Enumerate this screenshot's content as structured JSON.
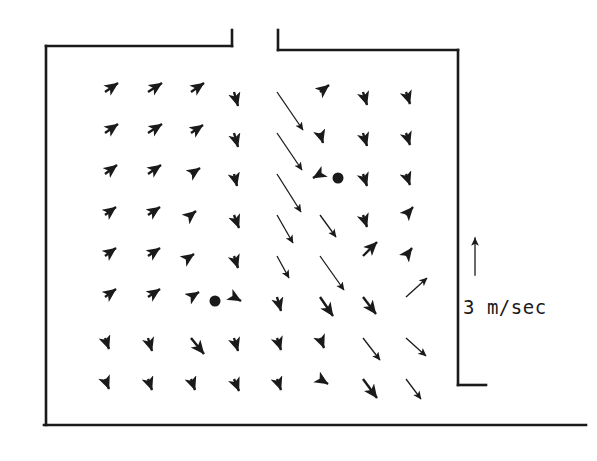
{
  "figure": {
    "type": "velocity-vector-field",
    "background_color": "#ffffff",
    "ink_color": "#1a1a1a"
  },
  "scale": {
    "label": "3 m/sec",
    "arrow_direction": "up",
    "arrow_x": 475,
    "arrow_tip_y": 238,
    "arrow_tail_y": 275,
    "arrow_length_px": 37
  },
  "enclosure": {
    "line_width": 2.6,
    "top_left_corner": [
      46,
      46
    ],
    "inlet_gap": {
      "left_x": 232,
      "right_x": 278,
      "top_y": 30,
      "wall_y": 46
    },
    "right_wall_x": 458,
    "right_wall_top_y": 50,
    "outlet_step_y": 385,
    "outlet_extends_to_x": 486,
    "left_wall_bottom_y": 425,
    "bottom_wall_y": 425,
    "bottom_wall_right_x": 486
  },
  "vortex_centers": [
    {
      "name": "right-vortex-center",
      "x": 338,
      "y": 178,
      "radius": 5.5
    },
    {
      "name": "left-vortex-center",
      "x": 215,
      "y": 301,
      "radius": 5.5
    }
  ],
  "chart_data": {
    "type": "scatter",
    "title": "",
    "xlabel": "",
    "ylabel": "",
    "grid_columns": 9,
    "grid_rows": 8,
    "grid_origin": [
      105,
      92
    ],
    "grid_spacing": [
      43,
      41
    ],
    "vectors": [
      [
        105,
        92,
        13,
        -9
      ],
      [
        148,
        92,
        14,
        -9
      ],
      [
        191,
        92,
        13,
        -9
      ],
      [
        234,
        92,
        4,
        14
      ],
      [
        277,
        92,
        26,
        38
      ],
      [
        320,
        92,
        9,
        -7
      ],
      [
        363,
        92,
        4,
        13
      ],
      [
        406,
        92,
        4,
        12
      ],
      [
        105,
        133,
        13,
        -9
      ],
      [
        148,
        133,
        14,
        -9
      ],
      [
        191,
        133,
        12,
        -8
      ],
      [
        234,
        133,
        4,
        14
      ],
      [
        277,
        133,
        25,
        37
      ],
      [
        320,
        133,
        3,
        10
      ],
      [
        363,
        133,
        4,
        13
      ],
      [
        406,
        133,
        4,
        12
      ],
      [
        105,
        174,
        12,
        -9
      ],
      [
        148,
        174,
        13,
        -9
      ],
      [
        191,
        174,
        9,
        -6
      ],
      [
        234,
        174,
        3,
        12
      ],
      [
        277,
        174,
        24,
        38
      ],
      [
        320,
        174,
        -7,
        4
      ],
      [
        363,
        174,
        4,
        12
      ],
      [
        406,
        174,
        4,
        11
      ],
      [
        105,
        215,
        11,
        -8
      ],
      [
        148,
        215,
        12,
        -8
      ],
      [
        191,
        215,
        5,
        -4
      ],
      [
        234,
        215,
        5,
        13
      ],
      [
        277,
        215,
        16,
        28
      ],
      [
        320,
        215,
        16,
        22
      ],
      [
        363,
        215,
        4,
        12
      ],
      [
        406,
        215,
        7,
        -8
      ],
      [
        105,
        256,
        11,
        -8
      ],
      [
        148,
        256,
        12,
        -8
      ],
      [
        191,
        256,
        3,
        -2
      ],
      [
        234,
        256,
        4,
        12
      ],
      [
        277,
        256,
        12,
        22
      ],
      [
        320,
        256,
        24,
        34
      ],
      [
        363,
        256,
        14,
        -14
      ],
      [
        406,
        256,
        6,
        -8
      ],
      [
        105,
        297,
        11,
        -8
      ],
      [
        148,
        297,
        12,
        -8
      ],
      [
        191,
        297,
        8,
        -5
      ],
      [
        234,
        297,
        7,
        4
      ],
      [
        277,
        297,
        4,
        14
      ],
      [
        320,
        297,
        13,
        19
      ],
      [
        363,
        297,
        13,
        17
      ],
      [
        406,
        297,
        21,
        -19
      ],
      [
        105,
        338,
        4,
        11
      ],
      [
        148,
        338,
        4,
        13
      ],
      [
        191,
        338,
        13,
        16
      ],
      [
        234,
        338,
        4,
        13
      ],
      [
        277,
        338,
        4,
        12
      ],
      [
        320,
        338,
        4,
        10
      ],
      [
        363,
        338,
        17,
        22
      ],
      [
        406,
        338,
        20,
        18
      ],
      [
        105,
        379,
        4,
        10
      ],
      [
        148,
        379,
        4,
        11
      ],
      [
        191,
        379,
        4,
        11
      ],
      [
        234,
        379,
        5,
        12
      ],
      [
        277,
        379,
        4,
        11
      ],
      [
        320,
        379,
        8,
        5
      ],
      [
        363,
        379,
        14,
        19
      ],
      [
        406,
        379,
        15,
        20
      ]
    ]
  }
}
